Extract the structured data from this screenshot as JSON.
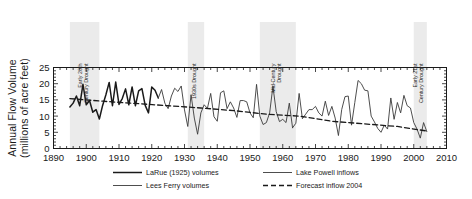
{
  "chart_data": {
    "type": "line",
    "title": "",
    "xlabel": "",
    "ylabel": "Annual Flow Volume (millions of acre feet)",
    "ylabel_line1": "Annual Flow Volume",
    "ylabel_line2": "(millions of acre feet)",
    "xlim": [
      1890,
      2010
    ],
    "ylim": [
      0,
      25
    ],
    "xticks": [
      1890,
      1900,
      1910,
      1920,
      1930,
      1940,
      1950,
      1960,
      1970,
      1980,
      1990,
      2000,
      2010
    ],
    "yticks": [
      0,
      5,
      10,
      15,
      20,
      25
    ],
    "xtick_labels": [
      "1890",
      "1900",
      "1910",
      "1920",
      "1930",
      "1940",
      "1950",
      "1960",
      "1970",
      "1980",
      "1990",
      "2000",
      "2010"
    ],
    "ytick_labels": [
      "0",
      "5",
      "10",
      "15",
      "20",
      "25"
    ],
    "xminor_step": 2,
    "yminor_step": 1,
    "grid": false,
    "legend_position": "below",
    "series": [
      {
        "name": "LaRue (1925) volumes",
        "style": "solid",
        "width": 1.5,
        "color": "#1a1a1a",
        "x": [
          1895,
          1896,
          1897,
          1898,
          1899,
          1900,
          1901,
          1902,
          1903,
          1904,
          1905,
          1906,
          1907,
          1908,
          1909,
          1910,
          1911,
          1912,
          1913,
          1914,
          1915,
          1916,
          1917,
          1918,
          1919,
          1920,
          1921,
          1922
        ],
        "values": [
          12.8,
          14.0,
          16.2,
          13.2,
          19.8,
          13.5,
          14.8,
          11.2,
          12.0,
          9.1,
          13.3,
          16.6,
          20.4,
          13.2,
          20.5,
          13.6,
          15.4,
          18.4,
          13.5,
          19.0,
          13.2,
          17.8,
          18.5,
          13.3,
          11.0,
          19.0,
          18.0,
          15.6
        ]
      },
      {
        "name": "Lees Ferry volumes",
        "style": "dotted",
        "width": 0.9,
        "color": "#3a3a3a",
        "x": [
          1922,
          1923,
          1924,
          1925,
          1926,
          1927,
          1928,
          1929,
          1930,
          1931,
          1932,
          1933,
          1934,
          1935,
          1936,
          1937,
          1938,
          1939,
          1940,
          1941,
          1942,
          1943,
          1944,
          1945,
          1946,
          1947,
          1948,
          1949,
          1950,
          1951,
          1952,
          1953,
          1954,
          1955,
          1956,
          1957,
          1958,
          1959,
          1960,
          1961,
          1962,
          1963
        ],
        "values": [
          15.6,
          18.2,
          14.0,
          12.3,
          16.2,
          18.6,
          17.6,
          19.3,
          11.9,
          6.8,
          16.6,
          9.4,
          4.4,
          11.0,
          13.5,
          12.4,
          17.0,
          9.8,
          8.4,
          17.2,
          17.8,
          12.3,
          14.4,
          12.5,
          9.6,
          14.8,
          14.8,
          14.4,
          11.0,
          9.5,
          19.8,
          10.0,
          7.4,
          8.0,
          11.0,
          19.2,
          11.4,
          8.3,
          9.0,
          8.0,
          14.0,
          6.4
        ]
      },
      {
        "name": "Lake Powell inflows",
        "style": "dotted",
        "width": 0.9,
        "color": "#3a3a3a",
        "x": [
          1963,
          1964,
          1965,
          1966,
          1967,
          1968,
          1969,
          1970,
          1971,
          1972,
          1973,
          1974,
          1975,
          1976,
          1977,
          1978,
          1979,
          1980,
          1981,
          1982,
          1983,
          1984,
          1985,
          1986,
          1987,
          1988,
          1989,
          1990,
          1991,
          1992,
          1993,
          1994,
          1995,
          1996,
          1997,
          1998,
          1999,
          2000,
          2001,
          2002,
          2003,
          2004
        ],
        "values": [
          6.4,
          7.8,
          17.0,
          9.2,
          10.6,
          12.0,
          12.0,
          13.0,
          11.0,
          10.0,
          14.6,
          10.2,
          13.0,
          9.4,
          4.0,
          12.0,
          16.0,
          16.2,
          7.2,
          14.2,
          21.0,
          20.0,
          18.0,
          17.8,
          10.0,
          8.2,
          6.2,
          5.0,
          7.2,
          6.0,
          15.6,
          9.0,
          14.2,
          11.0,
          16.4,
          13.2,
          12.5,
          8.0,
          6.0,
          3.2,
          8.0,
          5.2
        ]
      },
      {
        "name": "Forecast inflow 2004",
        "style": "dashed",
        "width": 1.3,
        "color": "#1a1a1a",
        "x": [
          1895,
          1905,
          1915,
          1925,
          1935,
          1945,
          1955,
          1965,
          1975,
          1985,
          1995,
          2004
        ],
        "values": [
          15.4,
          14.6,
          13.9,
          13.2,
          12.5,
          11.7,
          10.6,
          10.0,
          8.4,
          7.6,
          6.8,
          5.4
        ]
      }
    ],
    "drought_bands": [
      {
        "label": "Early 20th Century Drought",
        "label_line1": "Early 20th",
        "label_line2": "Century Drought",
        "start": 1895,
        "end": 1904
      },
      {
        "label": "1930s Drought",
        "label_line1": "1930s Drought",
        "label_line2": "",
        "start": 1931,
        "end": 1936
      },
      {
        "label": "Mid-Century Drought",
        "label_line1": "Mid-Century",
        "label_line2": "Drought",
        "start": 1953,
        "end": 1964
      },
      {
        "label": "Early 21st Century Drought",
        "label_line1": "Early 21st",
        "label_line2": "Century Drought",
        "start": 2000,
        "end": 2004
      }
    ]
  }
}
